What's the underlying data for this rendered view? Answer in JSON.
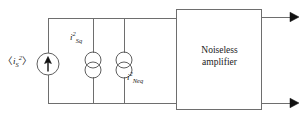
{
  "figure": {
    "kind": "circuit-diagram",
    "background_color": "#ffffff",
    "wire_color": "#6e6e6e",
    "symbol_color": "#5f5f5f",
    "arrow_color": "#111111",
    "text_color": "#1a1a1a"
  },
  "labels": {
    "source_current": {
      "open_bracket": "〈",
      "symbol": "i",
      "superscript": "2",
      "subscript": "S",
      "close_bracket": "〉",
      "plain": "<i_S^2>"
    },
    "shot_noise": {
      "symbol": "i",
      "superscript": "2",
      "subscript": "Sq",
      "plain": "i_Sq^2"
    },
    "amplifier_noise": {
      "symbol": "i",
      "superscript": "2",
      "subscript": "Neq",
      "plain": "i_Neq^2"
    }
  },
  "amplifier": {
    "line1": "Noiseless",
    "line2": "amplifier"
  },
  "nodes": {
    "top_rail_y": 18,
    "bottom_rail_y": 103,
    "left_rail_x": 48,
    "branch_x": [
      48,
      93,
      124
    ],
    "box_left": 176,
    "box_right": 262,
    "box_top": 9,
    "box_bottom": 110,
    "output_right_x": 296
  },
  "symbols": {
    "source": "current-source-arrow",
    "noise_source_1": "noise-current-source-double-circle",
    "noise_source_2": "noise-current-source-double-circle",
    "output_top": "arrow-right",
    "output_bottom": "arrow-right"
  }
}
